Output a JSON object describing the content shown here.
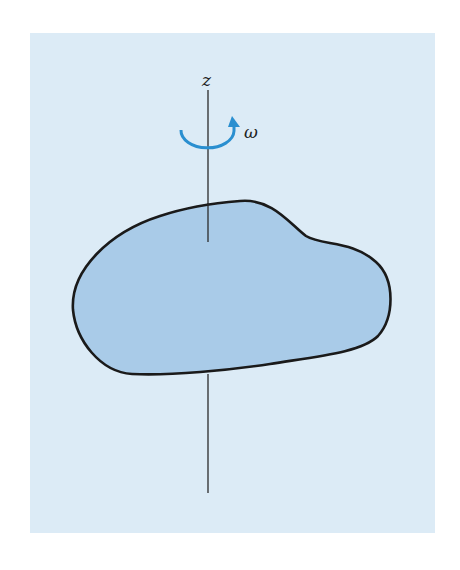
{
  "diagram": {
    "type": "rigid body rotating about an axis",
    "axis_label": "z",
    "angular_velocity_label": "ω",
    "colors": {
      "panel_background": "#dcebf6",
      "body_fill": "#a9cbe8",
      "outline": "#1a1a1a",
      "rotation_arrow": "#2a8fd0"
    }
  }
}
